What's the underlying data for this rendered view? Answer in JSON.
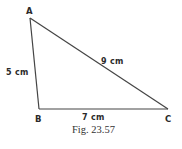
{
  "figure": {
    "caption": "Fig. 23.57",
    "shape": "triangle",
    "vertices": {
      "A": {
        "label": "A",
        "x": 30,
        "y": 18
      },
      "B": {
        "label": "B",
        "x": 39,
        "y": 109
      },
      "C": {
        "label": "C",
        "x": 168,
        "y": 109
      }
    },
    "sides": {
      "AB": {
        "label": "5 cm",
        "length_cm": 5
      },
      "BC": {
        "label": "7 cm",
        "length_cm": 7
      },
      "AC": {
        "label": "9 cm",
        "length_cm": 9
      }
    },
    "colors": {
      "line": "#444444",
      "text": "#2a2a2a",
      "background": "#ffffff"
    }
  }
}
